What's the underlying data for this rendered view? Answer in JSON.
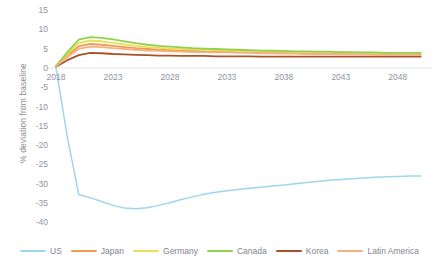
{
  "chart_data": {
    "type": "line",
    "title": "",
    "subtitle": "",
    "xlabel": "",
    "ylabel": "% deviation from baseline",
    "xlim": [
      2018,
      2051
    ],
    "ylim": [
      -42,
      16
    ],
    "grid": false,
    "legend_position": "bottom",
    "x_ticks": [
      "2018",
      "2023",
      "2028",
      "2033",
      "2038",
      "2043",
      "2048"
    ],
    "y_ticks": [
      "15",
      "10",
      "5",
      "0",
      "-5",
      "-10",
      "-15",
      "-20",
      "-25",
      "-30",
      "-35",
      "-40"
    ],
    "x": [
      2018,
      2019,
      2020,
      2021,
      2022,
      2023,
      2024,
      2025,
      2026,
      2027,
      2028,
      2029,
      2030,
      2031,
      2032,
      2033,
      2034,
      2035,
      2036,
      2037,
      2038,
      2039,
      2040,
      2041,
      2042,
      2043,
      2044,
      2045,
      2046,
      2047,
      2048,
      2049,
      2050
    ],
    "series": [
      {
        "name": "US",
        "color": "#9ed6ef",
        "values": [
          0.0,
          -18.0,
          -32.8,
          -33.6,
          -34.6,
          -35.6,
          -36.3,
          -36.5,
          -36.2,
          -35.6,
          -34.9,
          -34.1,
          -33.4,
          -32.7,
          -32.2,
          -31.8,
          -31.5,
          -31.2,
          -30.9,
          -30.6,
          -30.3,
          -30.0,
          -29.7,
          -29.4,
          -29.1,
          -28.9,
          -28.7,
          -28.5,
          -28.3,
          -28.2,
          -28.1,
          -28.0,
          -28.0
        ]
      },
      {
        "name": "Japan",
        "color": "#ef9b52",
        "values": [
          0.5,
          3.2,
          5.6,
          6.2,
          6.0,
          5.7,
          5.4,
          5.1,
          4.9,
          4.7,
          4.6,
          4.5,
          4.4,
          4.3,
          4.2,
          4.2,
          4.1,
          4.1,
          4.0,
          4.0,
          3.9,
          3.9,
          3.8,
          3.8,
          3.7,
          3.7,
          3.6,
          3.6,
          3.6,
          3.5,
          3.5,
          3.5,
          3.5
        ]
      },
      {
        "name": "Germany",
        "color": "#e8e157",
        "values": [
          0.5,
          3.6,
          6.4,
          7.1,
          6.9,
          6.5,
          6.1,
          5.7,
          5.4,
          5.2,
          5.0,
          4.9,
          4.8,
          4.7,
          4.6,
          4.5,
          4.4,
          4.4,
          4.3,
          4.2,
          4.2,
          4.1,
          4.1,
          4.0,
          4.0,
          3.9,
          3.9,
          3.8,
          3.8,
          3.7,
          3.7,
          3.7,
          3.7
        ]
      },
      {
        "name": "Canada",
        "color": "#92d050",
        "values": [
          0.5,
          4.1,
          7.3,
          8.0,
          7.8,
          7.4,
          6.9,
          6.4,
          6.0,
          5.7,
          5.5,
          5.3,
          5.1,
          5.0,
          4.9,
          4.8,
          4.7,
          4.6,
          4.5,
          4.5,
          4.4,
          4.3,
          4.3,
          4.2,
          4.2,
          4.1,
          4.1,
          4.0,
          4.0,
          3.9,
          3.9,
          3.9,
          3.9
        ]
      },
      {
        "name": "Korea",
        "color": "#a9522a",
        "values": [
          0.3,
          2.0,
          3.3,
          3.9,
          3.8,
          3.6,
          3.5,
          3.4,
          3.3,
          3.2,
          3.2,
          3.1,
          3.1,
          3.1,
          3.0,
          3.0,
          3.0,
          3.0,
          2.9,
          2.9,
          2.9,
          2.9,
          2.9,
          2.9,
          2.9,
          2.9,
          2.9,
          2.9,
          2.9,
          2.9,
          2.9,
          2.9,
          2.9
        ]
      },
      {
        "name": "Latin America",
        "color": "#f4b183",
        "values": [
          0.4,
          2.8,
          4.9,
          5.5,
          5.4,
          5.1,
          4.9,
          4.7,
          4.5,
          4.4,
          4.3,
          4.2,
          4.1,
          4.1,
          4.0,
          4.0,
          3.9,
          3.9,
          3.8,
          3.8,
          3.7,
          3.7,
          3.6,
          3.6,
          3.6,
          3.5,
          3.5,
          3.5,
          3.4,
          3.4,
          3.4,
          3.4,
          3.4
        ]
      }
    ]
  }
}
